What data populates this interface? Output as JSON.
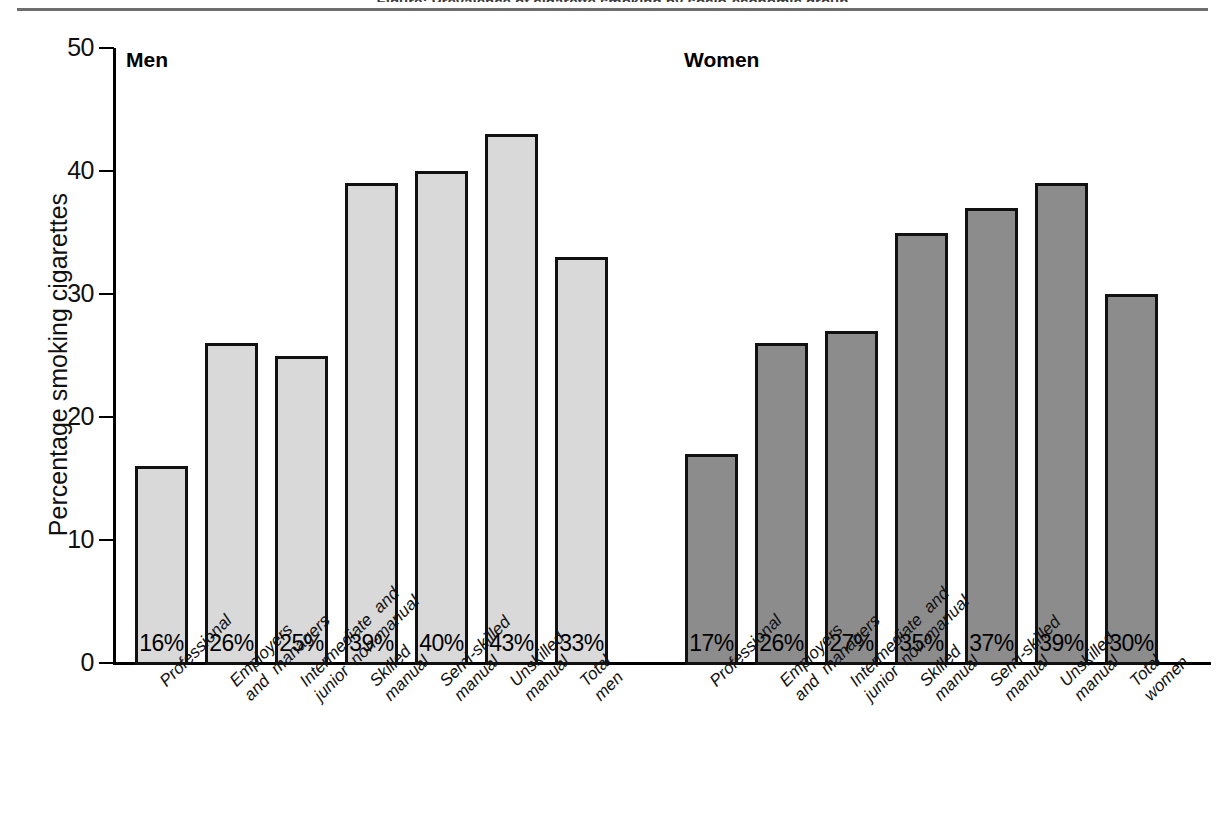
{
  "figure": {
    "top_rule": true,
    "caption_fragment": "Figure:  Prevalence of cigarette smoking by socio-economic group"
  },
  "axis": {
    "y_title": "Percentage smoking cigarettes",
    "y_ticks": [
      "0",
      "10",
      "20",
      "30",
      "40",
      "50"
    ]
  },
  "groups": {
    "men_title": "Men",
    "women_title": "Women"
  },
  "colors": {
    "men_fill": "#d9d9d9",
    "women_fill": "#8c8c8c",
    "bar_outline": "#111111",
    "axis": "#000000",
    "rule": "#6e6e6e"
  },
  "chart_data": {
    "type": "bar",
    "title": "Prevalence of cigarette smoking by socio-economic group",
    "xlabel": "",
    "ylabel": "Percentage smoking cigarettes",
    "ylim": [
      0,
      50
    ],
    "yticks": [
      0,
      10,
      20,
      30,
      40,
      50
    ],
    "grid": false,
    "legend": "none",
    "categories": [
      "Professional",
      "Employers and managers",
      "Intermediate and junior non-manual",
      "Skilled manual",
      "Semi-skilled manual",
      "Unskilled manual",
      "Total"
    ],
    "series": [
      {
        "name": "Men",
        "values": [
          16,
          26,
          25,
          39,
          40,
          43,
          33
        ],
        "value_labels": [
          "16%",
          "26%",
          "25%",
          "39%",
          "40%",
          "43%",
          "33%"
        ],
        "color": "#d9d9d9",
        "tick_labels": [
          [
            "Professional"
          ],
          [
            "Employers",
            "and  managers"
          ],
          [
            "Intermediate  and",
            "junior  non-manual"
          ],
          [
            "Skilled",
            "manual"
          ],
          [
            "Semi-skilled",
            "manual"
          ],
          [
            "Unskilled",
            "manual"
          ],
          [
            "Total",
            "men"
          ]
        ]
      },
      {
        "name": "Women",
        "values": [
          17,
          26,
          27,
          35,
          37,
          39,
          30
        ],
        "value_labels": [
          "17%",
          "26%",
          "27%",
          "35%",
          "37%",
          "39%",
          "30%"
        ],
        "color": "#8c8c8c",
        "tick_labels": [
          [
            "Professional"
          ],
          [
            "Employers",
            "and  managers"
          ],
          [
            "Intermediate  and",
            "junior  non-manual"
          ],
          [
            "Skilled",
            "manual"
          ],
          [
            "Semi-skilled",
            "manual"
          ],
          [
            "Unskilled",
            "manual"
          ],
          [
            "Total",
            "women"
          ]
        ]
      }
    ]
  }
}
